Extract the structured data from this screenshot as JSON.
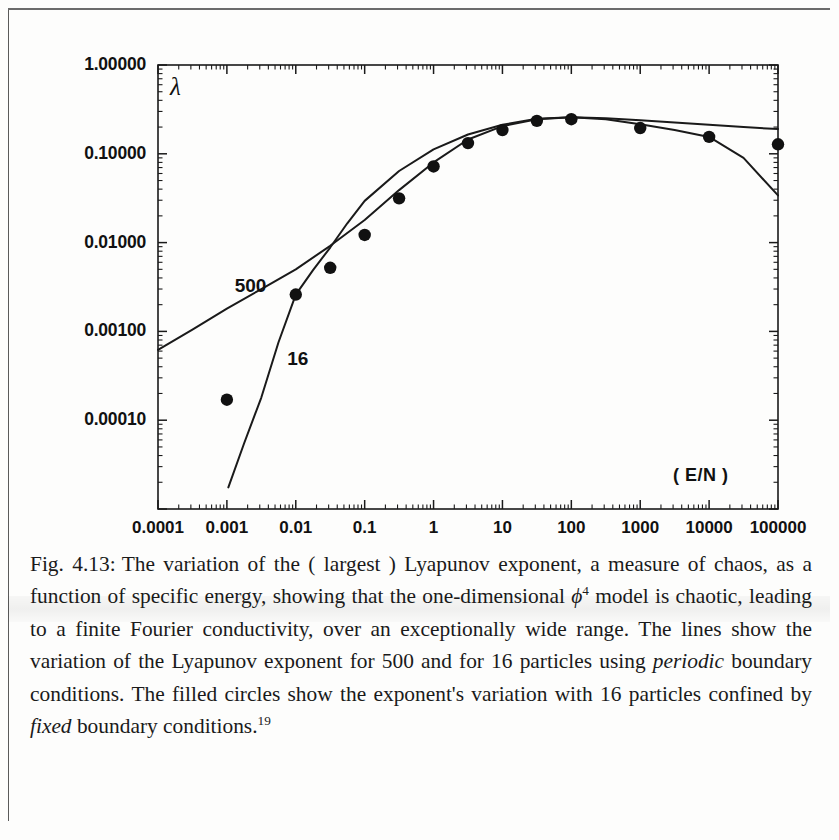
{
  "figure": {
    "y_axis": {
      "label": "λ",
      "tick_labels": [
        "1.00000",
        "0.10000",
        "0.01000",
        "0.00100",
        "0.00010"
      ],
      "tick_values": [
        1,
        0.1,
        0.01,
        0.001,
        0.0001
      ],
      "min": 1e-05,
      "max": 1.0
    },
    "x_axis": {
      "label": "( E/N )",
      "tick_labels": [
        "0.0001",
        "0.001",
        "0.01",
        "0.1",
        "1",
        "10",
        "100",
        "1000",
        "10000",
        "100000"
      ],
      "tick_values": [
        0.0001,
        0.001,
        0.01,
        0.1,
        1,
        10,
        100,
        1000,
        10000,
        100000
      ],
      "min": 0.0001,
      "max": 100000
    },
    "curve_labels": [
      {
        "text": "500",
        "x": 0.0013,
        "y": 0.0031
      },
      {
        "text": "16",
        "x": 0.0075,
        "y": 0.00046
      }
    ],
    "axis_color": "#1a1a1a",
    "marker_color": "#111111",
    "line_color": "#1a1a1a"
  },
  "caption": {
    "figure_number": "Fig. 4.13:",
    "part1": "The variation of the ( largest ) Lyapunov exponent, a measure of chaos, as a function of specific energy, showing that the one-dimensional ",
    "phi_symbol": "ϕ",
    "phi_exponent": "4",
    "part2": " model is chaotic, leading to a finite Fourier conductivity, over an exceptionally wide range. The lines show the variation of the Lyapunov exponent for 500 and for 16 particles using ",
    "italic1": "periodic",
    "part3": " boundary conditions. The filled circles show the exponent's variation with 16 particles confined by ",
    "italic2": "fixed",
    "part4": " boundary conditions.",
    "footnote": "19"
  },
  "chart_data": {
    "type": "line",
    "title": "The variation of the ( largest ) Lyapunov exponent",
    "xlabel": "( E/N )",
    "ylabel": "λ",
    "xscale": "log",
    "yscale": "log",
    "xlim": [
      0.0001,
      100000
    ],
    "ylim": [
      1e-05,
      1.0
    ],
    "grid": false,
    "legend": "inline-curve-labels",
    "series": [
      {
        "name": "500",
        "style": "line",
        "description": "Lyapunov exponent for 500 particles, periodic boundary conditions",
        "x": [
          0.0001,
          0.000316,
          0.001,
          0.00316,
          0.01,
          0.0316,
          0.1,
          0.316,
          1,
          3.16,
          10,
          31.6,
          100,
          316,
          1000,
          3160,
          10000,
          31600,
          100000
        ],
        "y": [
          0.00062,
          0.00105,
          0.0018,
          0.003,
          0.005,
          0.0092,
          0.018,
          0.039,
          0.08,
          0.145,
          0.205,
          0.245,
          0.258,
          0.252,
          0.238,
          0.225,
          0.212,
          0.2,
          0.19
        ]
      },
      {
        "name": "16",
        "style": "line",
        "description": "Lyapunov exponent for 16 particles, periodic boundary conditions",
        "x": [
          0.00105,
          0.00178,
          0.00316,
          0.0056,
          0.01,
          0.0178,
          0.0316,
          0.056,
          0.1,
          0.316,
          1,
          3.16,
          10,
          31.6,
          100,
          316,
          1000,
          3160,
          10000,
          31600,
          100000
        ],
        "y": [
          1.75e-05,
          5.5e-05,
          0.00018,
          0.00075,
          0.0026,
          0.0049,
          0.0088,
          0.0165,
          0.0295,
          0.064,
          0.112,
          0.165,
          0.212,
          0.248,
          0.258,
          0.245,
          0.215,
          0.185,
          0.155,
          0.09,
          0.034
        ]
      }
    ],
    "points": {
      "name": "16 particles, fixed boundary conditions",
      "style": "filled-circle",
      "x": [
        0.001,
        0.01,
        0.0316,
        0.1,
        0.316,
        1,
        3.16,
        10,
        31.6,
        100,
        1000,
        10000,
        100000
      ],
      "y": [
        0.00017,
        0.0026,
        0.0052,
        0.0122,
        0.0315,
        0.072,
        0.132,
        0.185,
        0.235,
        0.245,
        0.195,
        0.155,
        0.128
      ]
    }
  }
}
